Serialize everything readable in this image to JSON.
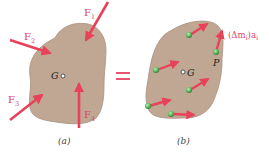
{
  "colors": {
    "body_fill": "#bfa794",
    "force_arrow": "#e8425b",
    "label": "#d9456a",
    "particle": "#5cb85c",
    "equals": "#e8556e",
    "center_label": "#222222"
  },
  "panel_a": {
    "caption": "(a)",
    "center_label": "G",
    "forces": [
      {
        "label": "F",
        "sub": "1"
      },
      {
        "label": "F",
        "sub": "2"
      },
      {
        "label": "F",
        "sub": "3"
      },
      {
        "label": "F",
        "sub": "4"
      }
    ]
  },
  "equals_sign": "=",
  "panel_b": {
    "caption": "(b)",
    "center_label": "G",
    "point_label": "P",
    "inertia_label": "(Δm",
    "inertia_sub": "i",
    "inertia_label_end": ")a",
    "inertia_sub2": "i"
  }
}
